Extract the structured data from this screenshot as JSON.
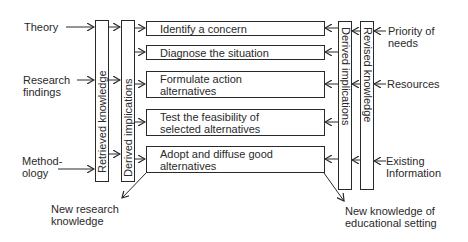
{
  "inputs_left": [
    {
      "label": "Theory"
    },
    {
      "label_lines": [
        "Research",
        "findings"
      ]
    },
    {
      "label_lines": [
        "Method-",
        "ology"
      ]
    }
  ],
  "columns": {
    "left_retrieved": "Retrieved knowledge",
    "left_derived": "Derived implications",
    "right_derived": "Derived implications",
    "right_revised": "Revised knowledge"
  },
  "steps": [
    {
      "lines": [
        "Identify a concern"
      ]
    },
    {
      "lines": [
        "Diagnose the situation"
      ]
    },
    {
      "lines": [
        "Formulate action",
        "alternatives"
      ]
    },
    {
      "lines": [
        "Test the feasibility of",
        "selected alternatives"
      ]
    },
    {
      "lines": [
        "Adopt and diffuse good",
        "alternatives"
      ]
    }
  ],
  "inputs_right": [
    {
      "label_lines": [
        "Priority of",
        "needs"
      ]
    },
    {
      "label": "Resources"
    },
    {
      "label_lines": [
        "Existing",
        "Information"
      ]
    }
  ],
  "outputs": {
    "left": [
      "New research",
      "knowledge"
    ],
    "right": [
      "New knowledge of",
      "educational setting"
    ]
  }
}
